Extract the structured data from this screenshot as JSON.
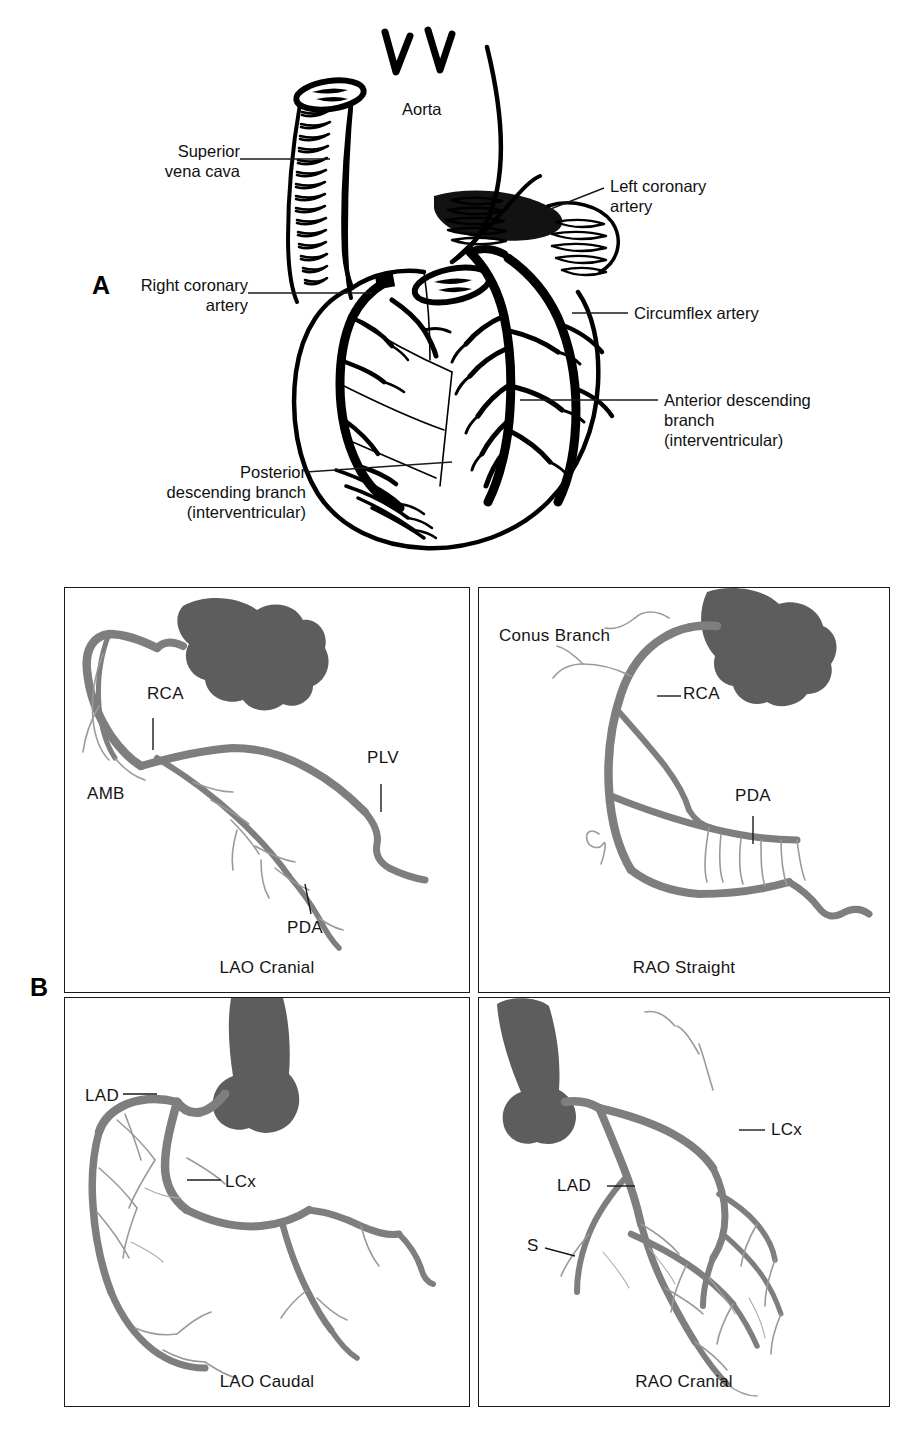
{
  "figure": {
    "panel_a_letter": "A",
    "panel_b_letter": "B",
    "panel_a_caption_labels": [
      {
        "key": "superior_vena_cava",
        "text": "Superior\nvena cava"
      },
      {
        "key": "aorta",
        "text": "Aorta"
      },
      {
        "key": "left_coronary_artery",
        "text": "Left coronary\nartery"
      },
      {
        "key": "right_coronary_artery",
        "text": "Right coronary\nartery"
      },
      {
        "key": "circumflex_artery",
        "text": "Circumflex artery"
      },
      {
        "key": "anterior_descending_branch",
        "text": "Anterior descending\nbranch\n(interventricular)"
      },
      {
        "key": "posterior_descending_branch",
        "text": "Posterior\ndescending branch\n(interventricular)"
      }
    ],
    "panel_b_views": [
      {
        "id": "lao-cranial",
        "view_name": "LAO Cranial",
        "vessel_system": "right coronary artery",
        "labels": [
          {
            "key": "rca",
            "text": "RCA"
          },
          {
            "key": "amb",
            "text": "AMB"
          },
          {
            "key": "plv",
            "text": "PLV"
          },
          {
            "key": "pda",
            "text": "PDA"
          }
        ]
      },
      {
        "id": "rao-straight",
        "view_name": "RAO Straight",
        "vessel_system": "right coronary artery",
        "labels": [
          {
            "key": "conus-branch",
            "text": "Conus Branch"
          },
          {
            "key": "rca",
            "text": "RCA"
          },
          {
            "key": "pda",
            "text": "PDA"
          }
        ]
      },
      {
        "id": "lao-caudal",
        "view_name": "LAO Caudal",
        "vessel_system": "left coronary artery",
        "labels": [
          {
            "key": "lad",
            "text": "LAD"
          },
          {
            "key": "lcx",
            "text": "LCx"
          }
        ]
      },
      {
        "id": "rao-cranial",
        "view_name": "RAO Cranial",
        "vessel_system": "left coronary artery",
        "labels": [
          {
            "key": "lad",
            "text": "LAD"
          },
          {
            "key": "lcx",
            "text": "LCx"
          },
          {
            "key": "s",
            "text": "S"
          }
        ]
      }
    ]
  },
  "colors": {
    "ink": "#000000",
    "vessel_gray": "#7e7e7e",
    "catheter_blob_gray": "#5d5d5d",
    "frame_border": "#1a1a1a",
    "background": "#ffffff"
  }
}
